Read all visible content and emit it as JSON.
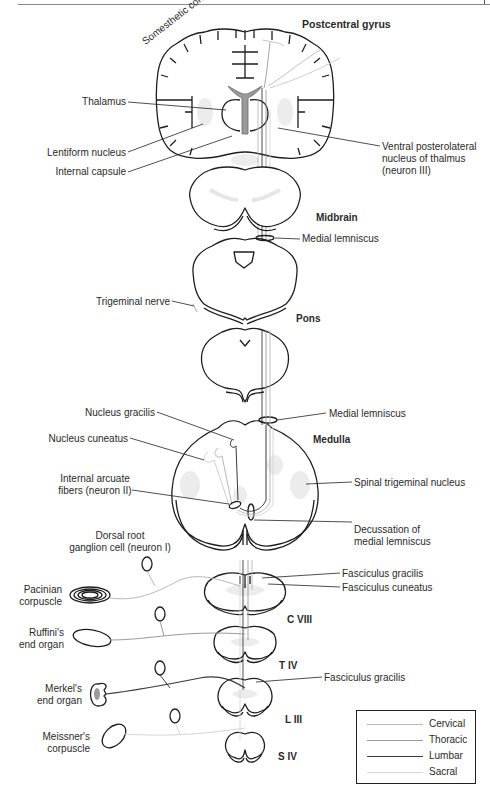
{
  "figure": {
    "section_labels": {
      "postcentral_gyrus": "Postcentral gyrus",
      "somesthetic_cortex": "Somesthetic cortex",
      "midbrain": "Midbrain",
      "pons": "Pons",
      "medulla": "Medulla",
      "c8": "C VIII",
      "t4": "T IV",
      "l3": "L III",
      "s4": "S IV"
    },
    "left_labels": {
      "thalamus": "Thalamus",
      "lentiform_nucleus": "Lentiform nucleus",
      "internal_capsule": "Internal capsule",
      "trigeminal_nerve": "Trigeminal nerve",
      "nucleus_gracilis": "Nucleus gracilis",
      "nucleus_cuneatus": "Nucleus cuneatus",
      "internal_arcuate_1": "Internal arcuate",
      "internal_arcuate_2": "fibers (neuron II)",
      "drg_1": "Dorsal root",
      "drg_2": "ganglion cell (neuron I)",
      "pacinian_1": "Pacinian",
      "pacinian_2": "corpuscle",
      "ruffini_1": "Ruffini's",
      "ruffini_2": "end organ",
      "merkel_1": "Merkel's",
      "merkel_2": "end organ",
      "meissner_1": "Meissner's",
      "meissner_2": "corpuscle"
    },
    "right_labels": {
      "vpl_1": "Ventral posterolateral",
      "vpl_2": "nucleus of thalmus",
      "vpl_3": "(neuron III)",
      "medial_lemniscus_1": "Medial lemniscus",
      "medial_lemniscus_2": "Medial lemniscus",
      "spinal_trigeminal": "Spinal trigeminal nucleus",
      "decussation_1": "Decussation of",
      "decussation_2": "medial lemniscus",
      "fasciculus_gracilis_1": "Fasciculus gracilis",
      "fasciculus_cuneatus": "Fasciculus cuneatus",
      "fasciculus_gracilis_2": "Fasciculus gracilis"
    },
    "legend": {
      "items": [
        {
          "label": "Cervical",
          "color": "#b8b8b8",
          "width": 1.2
        },
        {
          "label": "Thoracic",
          "color": "#9a9a9a",
          "width": 1.2
        },
        {
          "label": "Lumbar",
          "color": "#3a3a3a",
          "width": 1.6
        },
        {
          "label": "Sacral",
          "color": "#d6d6d6",
          "width": 1.2
        }
      ]
    },
    "colors": {
      "outline": "#1e1e1e",
      "ventricle_fill": "#9a9a9a",
      "nucleus_fill": "#ececec",
      "grey_matter": "#efefef"
    }
  }
}
